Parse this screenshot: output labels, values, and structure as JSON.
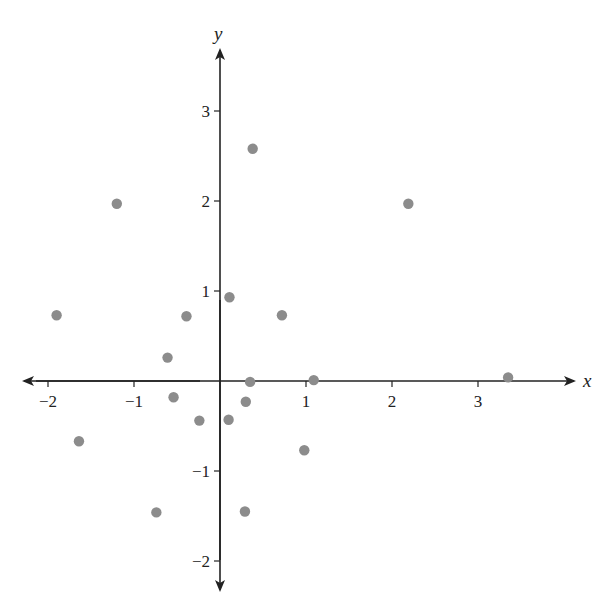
{
  "chart_data": {
    "type": "scatter",
    "title": "",
    "xlabel": "x",
    "ylabel": "y",
    "xlim": [
      -2.2,
      3.7
    ],
    "ylim": [
      -2.3,
      3.6
    ],
    "grid": false,
    "legend": null,
    "x_ticks": [
      -2,
      -1,
      1,
      2,
      3
    ],
    "x_tick_labels": [
      "−2",
      "−1",
      "1",
      "2",
      "3"
    ],
    "y_ticks": [
      -2,
      -1,
      1,
      2,
      3
    ],
    "y_tick_labels": [
      "−2",
      "−1",
      "1",
      "2",
      "3"
    ],
    "marker_color": "#8c8c8c",
    "axis_color": "#222222",
    "points": [
      {
        "x": -1.9,
        "y": 0.73
      },
      {
        "x": -1.2,
        "y": 1.97
      },
      {
        "x": -1.64,
        "y": -0.67
      },
      {
        "x": -0.74,
        "y": -1.46
      },
      {
        "x": -0.61,
        "y": 0.26
      },
      {
        "x": -0.54,
        "y": -0.18
      },
      {
        "x": -0.39,
        "y": 0.72
      },
      {
        "x": -0.24,
        "y": -0.44
      },
      {
        "x": 0.11,
        "y": 0.93
      },
      {
        "x": 0.1,
        "y": -0.43
      },
      {
        "x": 0.3,
        "y": -0.23
      },
      {
        "x": 0.35,
        "y": -0.01
      },
      {
        "x": 0.29,
        "y": -1.45
      },
      {
        "x": 0.38,
        "y": 2.58
      },
      {
        "x": 0.72,
        "y": 0.73
      },
      {
        "x": 0.98,
        "y": -0.77
      },
      {
        "x": 1.09,
        "y": 0.01
      },
      {
        "x": 2.19,
        "y": 1.97
      },
      {
        "x": 3.35,
        "y": 0.04
      }
    ]
  }
}
